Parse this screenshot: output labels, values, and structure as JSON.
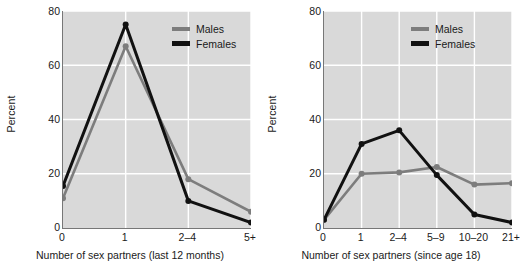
{
  "figure": {
    "background": "#ffffff",
    "plot_background": "#d9d9d9",
    "gridline_color": "#ffffff",
    "axis_color": "#777777",
    "males_color": "#7d7d7d",
    "females_color": "#111111"
  },
  "chart_data": [
    {
      "id": "last-12-months",
      "type": "line",
      "title": "",
      "xlabel": "Number of sex partners (last 12 months)",
      "ylabel": "Percent",
      "categories": [
        "0",
        "1",
        "2–4",
        "5+"
      ],
      "yticks": [
        0,
        20,
        40,
        60,
        80
      ],
      "ylim": [
        0,
        80
      ],
      "grid": true,
      "legend_position": "top-right",
      "series": [
        {
          "name": "Males",
          "color": "#7d7d7d",
          "values": [
            11,
            67,
            18,
            6
          ]
        },
        {
          "name": "Females",
          "color": "#111111",
          "values": [
            15.5,
            75,
            10,
            2
          ]
        }
      ]
    },
    {
      "id": "since-age-18",
      "type": "line",
      "title": "",
      "xlabel": "Number of sex partners (since age 18)",
      "ylabel": "Percent",
      "categories": [
        "0",
        "1",
        "2–4",
        "5–9",
        "10–20",
        "21+"
      ],
      "yticks": [
        0,
        20,
        40,
        60,
        80
      ],
      "ylim": [
        0,
        80
      ],
      "grid": true,
      "legend_position": "top-right",
      "series": [
        {
          "name": "Males",
          "color": "#7d7d7d",
          "values": [
            3,
            20,
            20.5,
            22.5,
            16,
            16.5
          ]
        },
        {
          "name": "Females",
          "color": "#111111",
          "values": [
            3,
            31,
            36,
            19.5,
            5,
            2
          ]
        }
      ]
    }
  ]
}
